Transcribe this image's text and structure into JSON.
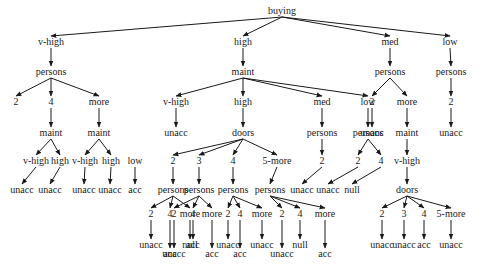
{
  "diagram": {
    "type": "decision-tree",
    "arrow_color": "#1a1a1a",
    "nodes": [
      {
        "id": "n0",
        "label": "buying",
        "x": 282,
        "y": 14
      },
      {
        "id": "n1",
        "label": "v-high",
        "x": 51,
        "y": 45
      },
      {
        "id": "n2",
        "label": "high",
        "x": 243,
        "y": 45
      },
      {
        "id": "n3",
        "label": "med",
        "x": 390,
        "y": 45
      },
      {
        "id": "n4",
        "label": "low",
        "x": 450,
        "y": 45
      },
      {
        "id": "n5",
        "label": "persons",
        "x": 51,
        "y": 75
      },
      {
        "id": "n6",
        "label": "maint",
        "x": 243,
        "y": 75
      },
      {
        "id": "n7",
        "label": "persons",
        "x": 390,
        "y": 75
      },
      {
        "id": "n8",
        "label": "persons",
        "x": 451,
        "y": 75
      },
      {
        "id": "n9",
        "label": "2",
        "x": 16,
        "y": 105
      },
      {
        "id": "n10",
        "label": "4",
        "x": 51,
        "y": 105
      },
      {
        "id": "n11",
        "label": "more",
        "x": 99,
        "y": 105
      },
      {
        "id": "n12",
        "label": "v-high",
        "x": 176,
        "y": 105
      },
      {
        "id": "n13",
        "label": "high",
        "x": 243,
        "y": 105
      },
      {
        "id": "n14",
        "label": "med",
        "x": 322,
        "y": 105
      },
      {
        "id": "n15",
        "label": "low",
        "x": 368,
        "y": 105
      },
      {
        "id": "n16",
        "label": "2",
        "x": 372,
        "y": 105
      },
      {
        "id": "n17",
        "label": "more",
        "x": 407,
        "y": 105
      },
      {
        "id": "n18",
        "label": "2",
        "x": 451,
        "y": 105
      },
      {
        "id": "n19",
        "label": "maint",
        "x": 51,
        "y": 136
      },
      {
        "id": "n20",
        "label": "maint",
        "x": 99,
        "y": 136
      },
      {
        "id": "n21",
        "label": "unacc",
        "x": 176,
        "y": 136
      },
      {
        "id": "n22",
        "label": "doors",
        "x": 243,
        "y": 136
      },
      {
        "id": "n23",
        "label": "persons",
        "x": 322,
        "y": 136
      },
      {
        "id": "n24",
        "label": "persons",
        "x": 368,
        "y": 136
      },
      {
        "id": "n25",
        "label": "unacc",
        "x": 372,
        "y": 136
      },
      {
        "id": "n26",
        "label": "maint",
        "x": 407,
        "y": 136
      },
      {
        "id": "n27",
        "label": "unacc",
        "x": 451,
        "y": 136
      },
      {
        "id": "n28",
        "label": "v-high",
        "x": 36,
        "y": 164
      },
      {
        "id": "n29",
        "label": "high",
        "x": 60,
        "y": 164
      },
      {
        "id": "n30",
        "label": "v-high",
        "x": 85,
        "y": 164
      },
      {
        "id": "n31",
        "label": "high",
        "x": 111,
        "y": 164
      },
      {
        "id": "n32",
        "label": "low",
        "x": 135,
        "y": 164
      },
      {
        "id": "n33",
        "label": "2",
        "x": 173,
        "y": 164
      },
      {
        "id": "n34",
        "label": "3",
        "x": 199,
        "y": 164
      },
      {
        "id": "n35",
        "label": "4",
        "x": 233,
        "y": 164
      },
      {
        "id": "n36",
        "label": "5-more",
        "x": 277,
        "y": 164
      },
      {
        "id": "n37",
        "label": "2",
        "x": 322,
        "y": 164
      },
      {
        "id": "n38",
        "label": "2",
        "x": 358,
        "y": 164
      },
      {
        "id": "n39",
        "label": "4",
        "x": 381,
        "y": 164
      },
      {
        "id": "n40",
        "label": "v-high",
        "x": 407,
        "y": 164
      },
      {
        "id": "n41",
        "label": "unacc",
        "x": 22,
        "y": 193
      },
      {
        "id": "n42",
        "label": "unacc",
        "x": 50,
        "y": 193
      },
      {
        "id": "n43",
        "label": "unacc",
        "x": 84,
        "y": 193
      },
      {
        "id": "n44",
        "label": "unacc",
        "x": 110,
        "y": 193
      },
      {
        "id": "n45",
        "label": "acc",
        "x": 135,
        "y": 193
      },
      {
        "id": "n46",
        "label": "persons",
        "x": 173,
        "y": 193
      },
      {
        "id": "n47",
        "label": "persons",
        "x": 199,
        "y": 193
      },
      {
        "id": "n48",
        "label": "persons",
        "x": 233,
        "y": 193
      },
      {
        "id": "n49",
        "label": "persons",
        "x": 270,
        "y": 193
      },
      {
        "id": "n50",
        "label": "unacc",
        "x": 302,
        "y": 193
      },
      {
        "id": "n51",
        "label": "unacc",
        "x": 328,
        "y": 193
      },
      {
        "id": "n52",
        "label": "null",
        "x": 352,
        "y": 193
      },
      {
        "id": "n53",
        "label": "doors",
        "x": 407,
        "y": 193
      },
      {
        "id": "n54",
        "label": "2",
        "x": 151,
        "y": 217
      },
      {
        "id": "n55",
        "label": "4",
        "x": 170,
        "y": 217
      },
      {
        "id": "n56",
        "label": "more",
        "x": 190,
        "y": 217
      },
      {
        "id": "n57",
        "label": "2",
        "x": 174,
        "y": 217
      },
      {
        "id": "n58",
        "label": "4",
        "x": 193,
        "y": 217
      },
      {
        "id": "n59",
        "label": "more",
        "x": 212,
        "y": 217
      },
      {
        "id": "n60",
        "label": "2",
        "x": 228,
        "y": 217
      },
      {
        "id": "n61",
        "label": "4",
        "x": 240,
        "y": 217
      },
      {
        "id": "n62",
        "label": "more",
        "x": 262,
        "y": 217
      },
      {
        "id": "n63",
        "label": "2",
        "x": 282,
        "y": 217
      },
      {
        "id": "n64",
        "label": "4",
        "x": 300,
        "y": 217
      },
      {
        "id": "n65",
        "label": "more",
        "x": 325,
        "y": 217
      },
      {
        "id": "n66",
        "label": "2",
        "x": 382,
        "y": 217
      },
      {
        "id": "n67",
        "label": "3",
        "x": 404,
        "y": 217
      },
      {
        "id": "n68",
        "label": "4",
        "x": 424,
        "y": 217
      },
      {
        "id": "n69",
        "label": "5-more",
        "x": 451,
        "y": 217
      },
      {
        "id": "n70",
        "label": "unacc",
        "x": 151,
        "y": 248
      },
      {
        "id": "n71",
        "label": "acc",
        "x": 170,
        "y": 257
      },
      {
        "id": "n72",
        "label": "null",
        "x": 190,
        "y": 248
      },
      {
        "id": "n73",
        "label": "unacc",
        "x": 174,
        "y": 257
      },
      {
        "id": "n74",
        "label": "acc",
        "x": 193,
        "y": 248
      },
      {
        "id": "n75",
        "label": "acc",
        "x": 212,
        "y": 257
      },
      {
        "id": "n76",
        "label": "unacc",
        "x": 228,
        "y": 248
      },
      {
        "id": "n77",
        "label": "acc",
        "x": 240,
        "y": 257
      },
      {
        "id": "n78",
        "label": "unacc",
        "x": 262,
        "y": 248
      },
      {
        "id": "n79",
        "label": "unacc",
        "x": 282,
        "y": 257
      },
      {
        "id": "n80",
        "label": "null",
        "x": 300,
        "y": 248
      },
      {
        "id": "n81",
        "label": "acc",
        "x": 325,
        "y": 257
      },
      {
        "id": "n82",
        "label": "unacc",
        "x": 382,
        "y": 248
      },
      {
        "id": "n83",
        "label": "unacc",
        "x": 404,
        "y": 248
      },
      {
        "id": "n84",
        "label": "acc",
        "x": 424,
        "y": 248
      },
      {
        "id": "n85",
        "label": "unacc",
        "x": 451,
        "y": 248
      }
    ],
    "edges": [
      [
        "n0",
        "n1"
      ],
      [
        "n0",
        "n2"
      ],
      [
        "n0",
        "n3"
      ],
      [
        "n0",
        "n4"
      ],
      [
        "n1",
        "n5"
      ],
      [
        "n2",
        "n6"
      ],
      [
        "n3",
        "n7"
      ],
      [
        "n4",
        "n8"
      ],
      [
        "n5",
        "n9"
      ],
      [
        "n5",
        "n10"
      ],
      [
        "n5",
        "n11"
      ],
      [
        "n6",
        "n12"
      ],
      [
        "n6",
        "n13"
      ],
      [
        "n6",
        "n14"
      ],
      [
        "n6",
        "n15"
      ],
      [
        "n7",
        "n16"
      ],
      [
        "n7",
        "n17"
      ],
      [
        "n8",
        "n18"
      ],
      [
        "n10",
        "n19"
      ],
      [
        "n11",
        "n20"
      ],
      [
        "n12",
        "n21"
      ],
      [
        "n13",
        "n22"
      ],
      [
        "n14",
        "n23"
      ],
      [
        "n15",
        "n24"
      ],
      [
        "n16",
        "n25"
      ],
      [
        "n17",
        "n26"
      ],
      [
        "n18",
        "n27"
      ],
      [
        "n19",
        "n28"
      ],
      [
        "n19",
        "n29"
      ],
      [
        "n20",
        "n30"
      ],
      [
        "n20",
        "n31"
      ],
      [
        "n22",
        "n33"
      ],
      [
        "n22",
        "n34"
      ],
      [
        "n22",
        "n35"
      ],
      [
        "n22",
        "n36"
      ],
      [
        "n23",
        "n37"
      ],
      [
        "n24",
        "n38"
      ],
      [
        "n24",
        "n39"
      ],
      [
        "n26",
        "n40"
      ],
      [
        "n28",
        "n41"
      ],
      [
        "n29",
        "n42"
      ],
      [
        "n30",
        "n43"
      ],
      [
        "n31",
        "n44"
      ],
      [
        "n32",
        "n45"
      ],
      [
        "n33",
        "n46"
      ],
      [
        "n34",
        "n47"
      ],
      [
        "n35",
        "n48"
      ],
      [
        "n36",
        "n49"
      ],
      [
        "n37",
        "n50"
      ],
      [
        "n38",
        "n51"
      ],
      [
        "n39",
        "n52"
      ],
      [
        "n40",
        "n53"
      ],
      [
        "n46",
        "n54"
      ],
      [
        "n46",
        "n55"
      ],
      [
        "n46",
        "n56"
      ],
      [
        "n47",
        "n57"
      ],
      [
        "n47",
        "n58"
      ],
      [
        "n47",
        "n59"
      ],
      [
        "n48",
        "n60"
      ],
      [
        "n48",
        "n61"
      ],
      [
        "n48",
        "n62"
      ],
      [
        "n49",
        "n63"
      ],
      [
        "n49",
        "n64"
      ],
      [
        "n49",
        "n65"
      ],
      [
        "n53",
        "n66"
      ],
      [
        "n53",
        "n67"
      ],
      [
        "n53",
        "n68"
      ],
      [
        "n53",
        "n69"
      ],
      [
        "n54",
        "n70"
      ],
      [
        "n55",
        "n71"
      ],
      [
        "n56",
        "n72"
      ],
      [
        "n57",
        "n73"
      ],
      [
        "n58",
        "n74"
      ],
      [
        "n59",
        "n75"
      ],
      [
        "n60",
        "n76"
      ],
      [
        "n61",
        "n77"
      ],
      [
        "n62",
        "n78"
      ],
      [
        "n63",
        "n79"
      ],
      [
        "n64",
        "n80"
      ],
      [
        "n65",
        "n81"
      ],
      [
        "n66",
        "n82"
      ],
      [
        "n67",
        "n83"
      ],
      [
        "n68",
        "n84"
      ],
      [
        "n69",
        "n85"
      ]
    ]
  }
}
